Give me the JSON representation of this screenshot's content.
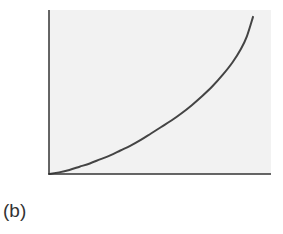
{
  "chart_data": {
    "type": "line",
    "title": "",
    "xlabel": "",
    "ylabel": "",
    "xlim": [
      0,
      1.08
    ],
    "ylim": [
      0,
      1
    ],
    "grid": false,
    "legend": "none",
    "x_ticks": [],
    "y_ticks": [],
    "series": [
      {
        "name": "curve",
        "color": "#444444",
        "x": [
          0,
          0.05,
          0.1,
          0.15,
          0.2,
          0.25,
          0.3,
          0.35,
          0.4,
          0.45,
          0.5,
          0.55,
          0.6,
          0.65,
          0.7,
          0.75,
          0.8,
          0.85,
          0.9,
          0.94,
          0.97,
          1.0
        ],
        "y": [
          0,
          0.01,
          0.025,
          0.045,
          0.065,
          0.09,
          0.115,
          0.145,
          0.175,
          0.21,
          0.25,
          0.29,
          0.33,
          0.375,
          0.425,
          0.48,
          0.54,
          0.61,
          0.69,
          0.77,
          0.85,
          0.97
        ]
      }
    ]
  },
  "colors": {
    "plot_background": "#f2f2f2",
    "axis": "#333333",
    "curve": "#444444"
  },
  "panel_label": "(b)"
}
